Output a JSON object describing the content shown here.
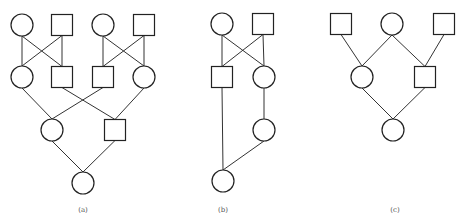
{
  "figure": {
    "background": "#ffffff",
    "stroke_color": "#222222",
    "panels": [
      {
        "id": "a",
        "label": "(a)",
        "label_pos": [
          83,
          212
        ],
        "nodes": [
          {
            "id": "a1",
            "shape": "circle",
            "cx": 22,
            "cy": 25
          },
          {
            "id": "a2",
            "shape": "square",
            "cx": 62,
            "cy": 25
          },
          {
            "id": "a3",
            "shape": "circle",
            "cx": 103,
            "cy": 25
          },
          {
            "id": "a4",
            "shape": "square",
            "cx": 144,
            "cy": 25
          },
          {
            "id": "a5",
            "shape": "circle",
            "cx": 22,
            "cy": 77
          },
          {
            "id": "a6",
            "shape": "square",
            "cx": 62,
            "cy": 77
          },
          {
            "id": "a7",
            "shape": "square",
            "cx": 103,
            "cy": 77
          },
          {
            "id": "a8",
            "shape": "circle",
            "cx": 144,
            "cy": 77
          },
          {
            "id": "a9",
            "shape": "circle",
            "cx": 52,
            "cy": 130
          },
          {
            "id": "a10",
            "shape": "square",
            "cx": 115,
            "cy": 130
          },
          {
            "id": "a11",
            "shape": "circle",
            "cx": 83,
            "cy": 183
          }
        ],
        "edges": [
          [
            "a1",
            "a5"
          ],
          [
            "a1",
            "a6"
          ],
          [
            "a2",
            "a5"
          ],
          [
            "a2",
            "a6"
          ],
          [
            "a3",
            "a7"
          ],
          [
            "a3",
            "a8"
          ],
          [
            "a4",
            "a7"
          ],
          [
            "a4",
            "a8"
          ],
          [
            "a5",
            "a9"
          ],
          [
            "a7",
            "a9"
          ],
          [
            "a6",
            "a10"
          ],
          [
            "a8",
            "a10"
          ],
          [
            "a9",
            "a11"
          ],
          [
            "a10",
            "a11"
          ]
        ]
      },
      {
        "id": "b",
        "label": "(b)",
        "label_pos": [
          223,
          212
        ],
        "nodes": [
          {
            "id": "b1",
            "shape": "circle",
            "cx": 222,
            "cy": 24
          },
          {
            "id": "b2",
            "shape": "square",
            "cx": 263,
            "cy": 24
          },
          {
            "id": "b3",
            "shape": "square",
            "cx": 222,
            "cy": 77
          },
          {
            "id": "b4",
            "shape": "circle",
            "cx": 264,
            "cy": 77
          },
          {
            "id": "b5",
            "shape": "circle",
            "cx": 264,
            "cy": 130
          },
          {
            "id": "b6",
            "shape": "circle",
            "cx": 223,
            "cy": 181
          }
        ],
        "edges": [
          [
            "b1",
            "b3"
          ],
          [
            "b1",
            "b4"
          ],
          [
            "b2",
            "b3"
          ],
          [
            "b2",
            "b4"
          ],
          [
            "b4",
            "b5"
          ],
          [
            "b3",
            "b6"
          ],
          [
            "b5",
            "b6"
          ]
        ]
      },
      {
        "id": "c",
        "label": "(c)",
        "label_pos": [
          395,
          212
        ],
        "nodes": [
          {
            "id": "c1",
            "shape": "square",
            "cx": 341,
            "cy": 24
          },
          {
            "id": "c2",
            "shape": "circle",
            "cx": 392,
            "cy": 24
          },
          {
            "id": "c3",
            "shape": "square",
            "cx": 444,
            "cy": 24
          },
          {
            "id": "c4",
            "shape": "circle",
            "cx": 362,
            "cy": 77
          },
          {
            "id": "c5",
            "shape": "square",
            "cx": 425,
            "cy": 77
          },
          {
            "id": "c6",
            "shape": "circle",
            "cx": 393,
            "cy": 130
          }
        ],
        "edges": [
          [
            "c1",
            "c4"
          ],
          [
            "c2",
            "c4"
          ],
          [
            "c2",
            "c5"
          ],
          [
            "c3",
            "c5"
          ],
          [
            "c4",
            "c6"
          ],
          [
            "c5",
            "c6"
          ]
        ]
      }
    ]
  }
}
